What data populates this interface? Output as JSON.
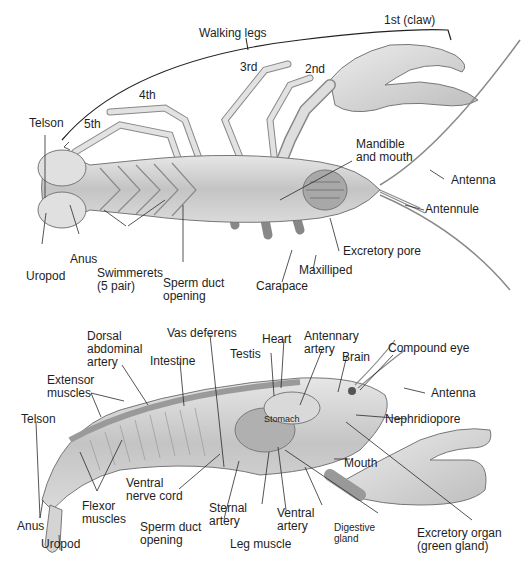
{
  "figure": {
    "colors": {
      "background": "#ffffff",
      "body": "#d6d6d6",
      "body_dark": "#9a9a9a",
      "outline": "#6e6e6e",
      "leader": "#2a2a2a",
      "text": "#1e1e1e"
    }
  },
  "ventral_view": {
    "walking_legs": "Walking legs",
    "leg_1": "1st (claw)",
    "leg_2": "2nd",
    "leg_3": "3rd",
    "leg_4": "4th",
    "leg_5": "5th",
    "telson": "Telson",
    "uropod": "Uropod",
    "anus": "Anus",
    "swimmerets_1": "Swimmerets",
    "swimmerets_2": "(5 pair)",
    "sperm_duct_1": "Sperm duct",
    "sperm_duct_2": "opening",
    "carapace": "Carapace",
    "maxilliped": "Maxilliped",
    "excretory_pore": "Excretory pore",
    "mandible_1": "Mandible",
    "mandible_2": "and mouth",
    "antenna": "Antenna",
    "antennule": "Antennule"
  },
  "lateral_view": {
    "dorsal_1": "Dorsal",
    "dorsal_2": "abdominal",
    "dorsal_3": "artery",
    "vas_deferens": "Vas deferens",
    "heart": "Heart",
    "antennary_1": "Antennary",
    "antennary_2": "artery",
    "testis": "Testis",
    "brain": "Brain",
    "compound_eye": "Compound eye",
    "intestine": "Intestine",
    "extensor_1": "Extensor",
    "extensor_2": "muscles",
    "antenna": "Antenna",
    "telson": "Telson",
    "stomach": "Stomach",
    "nephridiopore": "Nephridiopore",
    "mouth": "Mouth",
    "ventral_nerve_1": "Ventral",
    "ventral_nerve_2": "nerve cord",
    "flexor_1": "Flexor",
    "flexor_2": "muscles",
    "sternal_1": "Sternal",
    "sternal_2": "artery",
    "ventral_artery_1": "Ventral",
    "ventral_artery_2": "artery",
    "digestive_1": "Digestive",
    "digestive_2": "gland",
    "anus": "Anus",
    "sperm_duct_1": "Sperm duct",
    "sperm_duct_2": "opening",
    "leg_muscle": "Leg muscle",
    "uropod": "Uropod",
    "excretory_1": "Excretory organ",
    "excretory_2": "(green gland)"
  }
}
